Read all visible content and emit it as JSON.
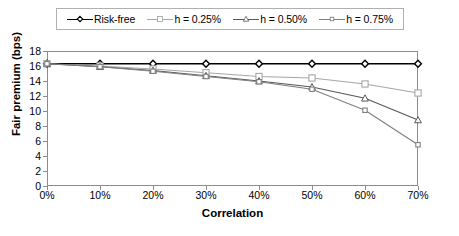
{
  "chart_data": {
    "type": "line",
    "title": "",
    "xlabel": "Correlation",
    "ylabel": "Fair premium (bps)",
    "categories": [
      "0%",
      "10%",
      "20%",
      "30%",
      "40%",
      "50%",
      "60%",
      "70%"
    ],
    "x": [
      0,
      10,
      20,
      30,
      40,
      50,
      60,
      70
    ],
    "xlim": [
      0,
      70
    ],
    "ylim": [
      0,
      18
    ],
    "yticks": [
      0,
      2,
      4,
      6,
      8,
      10,
      12,
      14,
      16,
      18
    ],
    "ytick_labels": [
      "0",
      "2",
      "4",
      "6",
      "8",
      "10",
      "12",
      "14",
      "16",
      "18"
    ],
    "grid": false,
    "legend_position": "top",
    "series": [
      {
        "name": "Risk-free",
        "values": [
          16.3,
          16.3,
          16.3,
          16.3,
          16.3,
          16.3,
          16.3,
          16.3
        ],
        "color": "#000000",
        "marker": "diamond"
      },
      {
        "name": "h = 0.25%",
        "values": [
          16.3,
          16.0,
          15.6,
          15.1,
          14.6,
          14.4,
          13.6,
          12.4
        ],
        "color": "#a6a6a6",
        "marker": "square"
      },
      {
        "name": "h = 0.50%",
        "values": [
          16.3,
          15.9,
          15.4,
          14.7,
          14.0,
          13.2,
          11.7,
          8.8
        ],
        "color": "#595959",
        "marker": "triangle"
      },
      {
        "name": "h = 0.75%",
        "values": [
          16.3,
          15.9,
          15.3,
          14.6,
          13.9,
          12.9,
          10.1,
          5.5
        ],
        "color": "#808080",
        "marker": "small-square"
      }
    ]
  },
  "legend": {
    "items": [
      {
        "label": "Risk-free"
      },
      {
        "label": "h = 0.25%"
      },
      {
        "label": "h = 0.50%"
      },
      {
        "label": "h = 0.75%"
      }
    ]
  },
  "axes": {
    "y_title": "Fair premium (bps)",
    "x_title": "Correlation"
  },
  "colors": {
    "frame": "#8c8c8c",
    "background": "#ffffff",
    "text": "#000000"
  }
}
